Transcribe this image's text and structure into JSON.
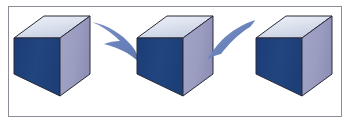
{
  "figure": {
    "description": "Three identical isometric cubes in a row connected by two curved swoosh arrows indicating a transformation or rotation sequence.",
    "width": 350,
    "height": 123,
    "background_color": "#FFFFFF",
    "frame": {
      "name": "outer-border",
      "color": "#8C8C96",
      "thickness": 1,
      "inset_left": 8,
      "inset_top": 6,
      "inset_right": 8,
      "inset_bottom": 7
    },
    "colors": {
      "cube_top_face": "#D2D9E8",
      "cube_top_face_highlight": "#E8EDF5",
      "cube_left_face": "#1F4280",
      "cube_left_face_shade": "#1A3A72",
      "cube_right_face": "#9A9CC0",
      "cube_right_face_shade": "#8F91B6",
      "cube_outline": "#2A2A38",
      "arrow_fill": "#6B83BC",
      "arrow_fill_light": "#8296C9",
      "arrow_shadow": "#7C8CBB"
    },
    "cubes": [
      {
        "name": "cube-left",
        "label": "Cube 1",
        "order": 1,
        "origin_x": 14,
        "origin_y": 16,
        "face_width": 46,
        "face_height": 58,
        "depth_x": 30,
        "depth_y": 22
      },
      {
        "name": "cube-middle",
        "label": "Cube 2",
        "order": 2,
        "origin_x": 137,
        "origin_y": 16,
        "face_width": 46,
        "face_height": 58,
        "depth_x": 30,
        "depth_y": 22
      },
      {
        "name": "cube-right",
        "label": "Cube 3",
        "order": 3,
        "origin_x": 256,
        "origin_y": 16,
        "face_width": 46,
        "face_height": 58,
        "depth_x": 30,
        "depth_y": 22
      }
    ],
    "arrows": [
      {
        "name": "arrow-left-to-middle",
        "label": "Transition arrow 1",
        "direction": "left-to-right",
        "from_cube": "cube-left",
        "to_cube": "cube-middle",
        "style": "curved-swoosh",
        "color": "#6B83BC"
      },
      {
        "name": "arrow-middle-to-right",
        "label": "Transition arrow 2",
        "direction": "right-to-left-sweep",
        "from_cube": "cube-right",
        "to_cube": "cube-middle",
        "style": "curved-swoosh",
        "color": "#6B83BC"
      }
    ]
  }
}
